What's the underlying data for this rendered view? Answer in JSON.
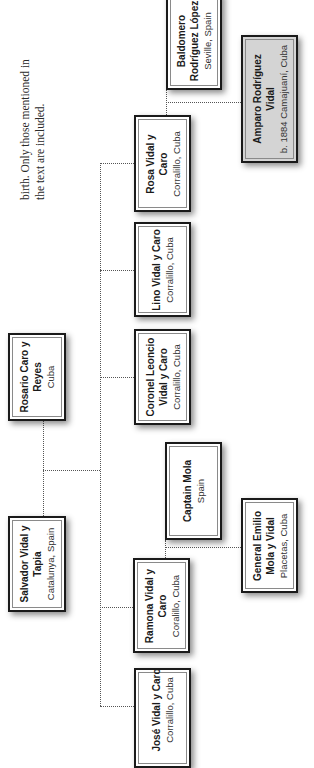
{
  "caption": {
    "lines": [
      "birth. Only those mentioned in",
      "the text are included."
    ]
  },
  "persons": {
    "salvador": {
      "name_lines": [
        "Salvador Vidal y",
        "Tapia"
      ],
      "place": "Catalunya, Spain"
    },
    "rosario": {
      "name_lines": [
        "Rosario Caro y",
        "Reyes"
      ],
      "place": "Cuba"
    },
    "jose": {
      "name_lines": [
        "José Vidal y Caro"
      ],
      "place": "Corralillo, Cuba"
    },
    "ramona": {
      "name_lines": [
        "Ramona Vidal y",
        "Caro"
      ],
      "place": "Coralillo, Cuba"
    },
    "captain_mola": {
      "name_lines": [
        "Captain Mola"
      ],
      "place": "Spain"
    },
    "coronel": {
      "name_lines": [
        "Coronel Leoncio",
        "Vidal y Caro"
      ],
      "place": "Corralillo, Cuba"
    },
    "lino": {
      "name_lines": [
        "Lino Vidal y Caro"
      ],
      "place": "Corralillo, Cuba"
    },
    "rosa": {
      "name_lines": [
        "Rosa Vidal y",
        "Caro"
      ],
      "place": "Corralillo, Cuba"
    },
    "baldomero": {
      "name_lines": [
        "Baldomero",
        "Rodríguez López"
      ],
      "place": "Seville, Spain"
    },
    "general_emilio": {
      "name_lines": [
        "General Emilio",
        "Mola y Vidal"
      ],
      "place": "Placetas, Cuba"
    },
    "amparo": {
      "name_lines": [
        "Amparo Rodríguez",
        "Vidal"
      ],
      "place": "b. 1884 Camajuaní, Cuba"
    }
  },
  "colors": {
    "box_border": "#1a1a1a",
    "box_fill": "#ffffff",
    "highlight_fill": "#d4d4d4",
    "connector": "#555555"
  }
}
